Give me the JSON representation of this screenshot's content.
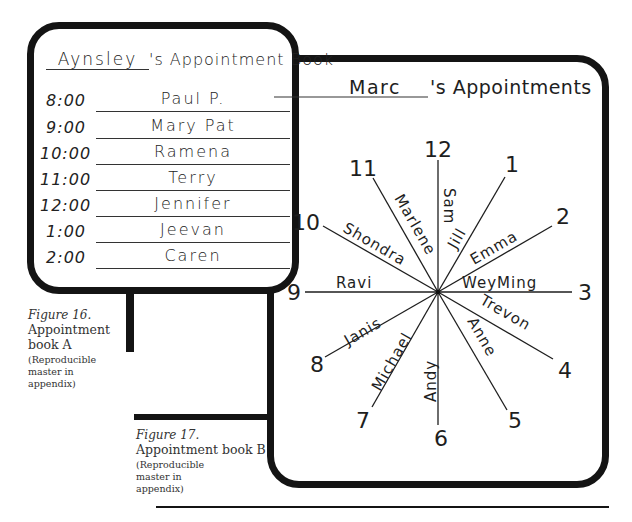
{
  "figure_a": {
    "title_name": "Aynsley",
    "title_suffix": "'s Appointment Book",
    "appointments": [
      {
        "time": "8:00",
        "name": "Paul P."
      },
      {
        "time": "9:00",
        "name": "Mary Pat"
      },
      {
        "time": "10:00",
        "name": "Ramena"
      },
      {
        "time": "11:00",
        "name": "Terry"
      },
      {
        "time": "12:00",
        "name": "Jennifer"
      },
      {
        "time": "1:00",
        "name": "Jeevan"
      },
      {
        "time": "2:00",
        "name": "Caren"
      }
    ],
    "caption": {
      "figure_label": "Figure 16.",
      "title": "Appointment book A",
      "note": "(Reproducible master in appendix)"
    }
  },
  "figure_b": {
    "title_name": "Marc",
    "title_suffix": "'s Appointments",
    "clock": [
      {
        "hour": "12",
        "name": "Sam"
      },
      {
        "hour": "1",
        "name": "Jill"
      },
      {
        "hour": "2",
        "name": "Emma"
      },
      {
        "hour": "3",
        "name": "WeyMing"
      },
      {
        "hour": "4",
        "name": "Trevon"
      },
      {
        "hour": "5",
        "name": "Anne"
      },
      {
        "hour": "6",
        "name": "Andy"
      },
      {
        "hour": "7",
        "name": "Michael"
      },
      {
        "hour": "8",
        "name": "Janis"
      },
      {
        "hour": "9",
        "name": "Ravi"
      },
      {
        "hour": "10",
        "name": "Shondra"
      },
      {
        "hour": "11",
        "name": "Marlene"
      }
    ],
    "caption": {
      "figure_label": "Figure 17.",
      "title": "Appointment book B",
      "note": "(Reproducible master in appendix)"
    }
  }
}
